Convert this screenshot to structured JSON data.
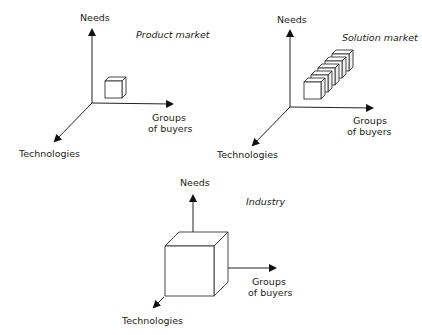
{
  "diagrams": [
    {
      "title": "Product market",
      "axes": {
        "y": "Needs",
        "x_line1": "Groups",
        "x_line2": "of buyers",
        "z": "Technologies"
      },
      "cube_count": 1
    },
    {
      "title": "Solution market",
      "axes": {
        "y": "Needs",
        "x_line1": "Groups",
        "x_line2": "of buyers",
        "z": "Technologies"
      },
      "cube_count": 5
    },
    {
      "title": "Industry",
      "axes": {
        "y": "Needs",
        "x_line1": "Groups",
        "x_line2": "of buyers",
        "z": "Technologies"
      },
      "cube_count": 1
    }
  ],
  "colors": {
    "line": "#222222",
    "background": "#ffffff"
  }
}
